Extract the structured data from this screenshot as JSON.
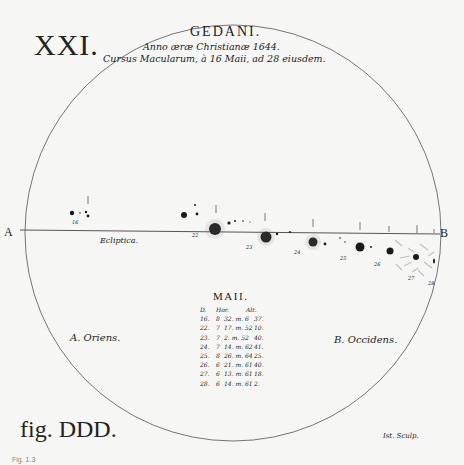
{
  "plate": {
    "number": "XXI.",
    "place": "GEDANI.",
    "subtitle_line1": "Anno æræ Christianæ 1644.",
    "subtitle_line2": "Cursus Macularum, à 16 Maii, ad 28 eiusdem.",
    "edge_left": "A",
    "edge_right": "B",
    "ecliptic_label": "Ecliptica.",
    "east_label": "A. Oriens.",
    "west_label": "B. Occidens.",
    "figure_label": "fig. DDD.",
    "engraver": "Ist. Sculp.",
    "caption": "Fig. 1.3"
  },
  "table": {
    "title": "MAII.",
    "headers": [
      "D.",
      "Hor.",
      "Alt."
    ],
    "rows": [
      {
        "d": "16.",
        "h": "8",
        "t": "32. m. 6",
        "a": "37."
      },
      {
        "d": "22.",
        "h": "7",
        "t": "17. m. 52",
        "a": "10."
      },
      {
        "d": "23.",
        "h": "7",
        "t": "2. m. 52",
        "a": "40."
      },
      {
        "d": "24.",
        "h": "7",
        "t": "14. m. 62",
        "a": "41."
      },
      {
        "d": "25.",
        "h": "8",
        "t": "26. m. 64",
        "a": "25."
      },
      {
        "d": "26.",
        "h": "6",
        "t": "21. m. 61",
        "a": "40."
      },
      {
        "d": "27.",
        "h": "6",
        "t": "13. m. 61",
        "a": "18."
      },
      {
        "d": "28.",
        "h": "6",
        "t": "14. m. 61",
        "a": "2."
      }
    ]
  },
  "sun_disk": {
    "center": [
      233,
      233
    ],
    "radius": 208,
    "stroke": "#555555"
  },
  "ecliptic_line": {
    "x1": 20,
    "y1": 230,
    "x2": 440,
    "y2": 234
  },
  "sunspots": [
    {
      "day": "16",
      "x": 72,
      "y": 213,
      "r": 2.2
    },
    {
      "day": "22",
      "x": 215,
      "y": 229,
      "r": 6
    },
    {
      "day": "23",
      "x": 266,
      "y": 237,
      "r": 5.5
    },
    {
      "day": "24",
      "x": 313,
      "y": 242,
      "r": 4.5
    },
    {
      "day": "25",
      "x": 360,
      "y": 247,
      "r": 4.5
    },
    {
      "day": "26",
      "x": 390,
      "y": 251,
      "r": 3.5
    },
    {
      "day": "27",
      "x": 416,
      "y": 257,
      "r": 3
    }
  ],
  "day_labels": [
    {
      "text": "16",
      "x": 74,
      "y": 222
    },
    {
      "text": "22",
      "x": 194,
      "y": 236
    },
    {
      "text": "23",
      "x": 248,
      "y": 247
    },
    {
      "text": "24",
      "x": 296,
      "y": 252
    },
    {
      "text": "25",
      "x": 342,
      "y": 258
    },
    {
      "text": "26",
      "x": 376,
      "y": 264
    },
    {
      "text": "27",
      "x": 410,
      "y": 278
    },
    {
      "text": "28",
      "x": 430,
      "y": 283
    }
  ]
}
